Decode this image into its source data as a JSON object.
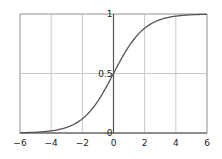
{
  "chart_data": {
    "type": "line",
    "title": "",
    "xlabel": "",
    "ylabel": "",
    "xlim": [
      -6,
      6
    ],
    "ylim": [
      0,
      1
    ],
    "grid": true,
    "legend": null,
    "function": "sigmoid: 1/(1+e^-x)",
    "x_ticks": [
      -6,
      -4,
      -2,
      0,
      2,
      4,
      6
    ],
    "x_tick_labels": [
      "−6",
      "−4",
      "−2",
      "0",
      "2",
      "4",
      "6"
    ],
    "y_ticks": [
      0,
      0.5,
      1
    ],
    "y_tick_labels": [
      "0",
      "0.5",
      "1"
    ],
    "series": [
      {
        "name": "sigmoid",
        "color": "#555555",
        "x": [
          -6,
          -5,
          -4,
          -3,
          -2,
          -1,
          0,
          1,
          2,
          3,
          4,
          5,
          6
        ],
        "y": [
          0.0025,
          0.0067,
          0.018,
          0.047,
          0.119,
          0.269,
          0.5,
          0.731,
          0.881,
          0.953,
          0.982,
          0.9933,
          0.9975
        ]
      }
    ]
  },
  "colors": {
    "grid": "#c8c8c8",
    "axis": "#555555",
    "curve": "#555555",
    "frame": "#aaaaaa"
  }
}
